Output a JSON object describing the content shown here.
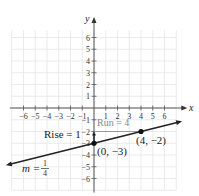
{
  "chart_data": {
    "type": "line",
    "title": "",
    "xlabel": "x",
    "ylabel": "y",
    "xlim": [
      -7,
      7
    ],
    "ylim": [
      -7,
      7
    ],
    "grid": true,
    "x_ticks": [
      -6,
      -5,
      -4,
      -3,
      -2,
      -1,
      1,
      2,
      3,
      4,
      5,
      6
    ],
    "x_tick_labels": [
      "−6",
      "−5",
      "−4",
      "−3",
      "−2",
      "−1",
      "1",
      "2",
      "3",
      "4",
      "5",
      "6"
    ],
    "y_ticks": [
      6,
      5,
      4,
      3,
      2,
      1,
      -1,
      -2,
      -3,
      -4,
      -5,
      -6
    ],
    "y_tick_labels": [
      "6",
      "5",
      "4",
      "3",
      "2",
      "1",
      "−1",
      "−2",
      "−3",
      "−4",
      "−5",
      "−6"
    ],
    "series": [
      {
        "name": "y = (1/4)x − 3",
        "slope": 0.25,
        "intercept": -3,
        "x": [
          -7.5,
          7.5
        ],
        "y": [
          -4.875,
          -1.125
        ]
      }
    ],
    "points": [
      {
        "x": 0,
        "y": -3,
        "label": "(0, −3)"
      },
      {
        "x": 4,
        "y": -2,
        "label": "(4, −2)"
      }
    ],
    "annotations": {
      "run": {
        "label": "Run = 4",
        "from": [
          0,
          -2
        ],
        "to": [
          4,
          -2
        ],
        "color": "#999999"
      },
      "rise": {
        "label": "Rise = 1",
        "from": [
          0,
          -3
        ],
        "to": [
          0,
          -2
        ]
      },
      "slope": {
        "label_prefix": "m =",
        "numerator": "1",
        "denominator": "4"
      }
    }
  },
  "colors": {
    "grid": "#e6e6e6",
    "axis": "#555555",
    "line": "#222222",
    "run": "#999999"
  }
}
